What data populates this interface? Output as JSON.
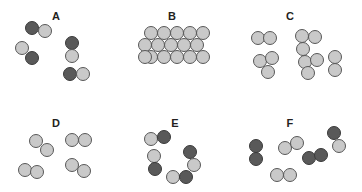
{
  "figure": {
    "width": 362,
    "height": 192,
    "background": "#ffffff",
    "type": "particle-diagram"
  },
  "colors": {
    "light_atom_fill": "#c9c9c9",
    "light_atom_stroke": "#585858",
    "dark_atom_fill": "#595959",
    "dark_atom_stroke": "#3a3a3a",
    "label_color": "#231f20",
    "background": "#ffffff"
  },
  "atom_radius": 7,
  "panels": [
    {
      "id": "A",
      "label": "A",
      "label_x": 56,
      "label_y": 10,
      "atom_count": 10,
      "composition": "5 diatomic molecules, each one dark atom bonded to one light atom",
      "atoms": [
        {
          "x": 32,
          "y": 28,
          "type": "dark"
        },
        {
          "x": 45,
          "y": 31,
          "type": "light"
        },
        {
          "x": 22,
          "y": 48,
          "type": "light"
        },
        {
          "x": 32,
          "y": 58,
          "type": "dark"
        },
        {
          "x": 72,
          "y": 43,
          "type": "dark"
        },
        {
          "x": 72,
          "y": 56,
          "type": "light"
        },
        {
          "x": 70,
          "y": 74,
          "type": "dark"
        },
        {
          "x": 83,
          "y": 74,
          "type": "light"
        }
      ]
    },
    {
      "id": "B",
      "label": "B",
      "label_x": 172,
      "label_y": 10,
      "atom_count": 16,
      "composition": "close-packed lattice of light gray atoms, three rows",
      "atoms": [
        {
          "x": 151,
          "y": 33,
          "type": "light"
        },
        {
          "x": 164,
          "y": 33,
          "type": "light"
        },
        {
          "x": 177,
          "y": 33,
          "type": "light"
        },
        {
          "x": 190,
          "y": 33,
          "type": "light"
        },
        {
          "x": 203,
          "y": 33,
          "type": "light"
        },
        {
          "x": 145,
          "y": 45,
          "type": "light"
        },
        {
          "x": 158,
          "y": 45,
          "type": "light"
        },
        {
          "x": 171,
          "y": 45,
          "type": "light"
        },
        {
          "x": 184,
          "y": 45,
          "type": "light"
        },
        {
          "x": 197,
          "y": 45,
          "type": "light"
        },
        {
          "x": 151,
          "y": 57,
          "type": "light"
        },
        {
          "x": 164,
          "y": 57,
          "type": "light"
        },
        {
          "x": 177,
          "y": 57,
          "type": "light"
        },
        {
          "x": 190,
          "y": 57,
          "type": "light"
        },
        {
          "x": 203,
          "y": 57,
          "type": "light"
        },
        {
          "x": 145,
          "y": 57,
          "type": "light"
        }
      ]
    },
    {
      "id": "C",
      "label": "C",
      "label_x": 290,
      "label_y": 10,
      "atom_count": 13,
      "composition": "clusters of light gray atoms: one pair, two triatomic bent groups, one triatomic, one pair",
      "atoms": [
        {
          "x": 258,
          "y": 38,
          "type": "light"
        },
        {
          "x": 270,
          "y": 38,
          "type": "light"
        },
        {
          "x": 260,
          "y": 61,
          "type": "light"
        },
        {
          "x": 272,
          "y": 58,
          "type": "light"
        },
        {
          "x": 268,
          "y": 72,
          "type": "light"
        },
        {
          "x": 302,
          "y": 36,
          "type": "light"
        },
        {
          "x": 315,
          "y": 37,
          "type": "light"
        },
        {
          "x": 303,
          "y": 49,
          "type": "light"
        },
        {
          "x": 305,
          "y": 62,
          "type": "light"
        },
        {
          "x": 317,
          "y": 60,
          "type": "light"
        },
        {
          "x": 308,
          "y": 73,
          "type": "light"
        },
        {
          "x": 335,
          "y": 57,
          "type": "light"
        },
        {
          "x": 335,
          "y": 70,
          "type": "light"
        }
      ]
    },
    {
      "id": "D",
      "label": "D",
      "label_x": 56,
      "label_y": 117,
      "atom_count": 8,
      "composition": "4 diatomic molecules, all light gray atoms",
      "atoms": [
        {
          "x": 36,
          "y": 141,
          "type": "light"
        },
        {
          "x": 47,
          "y": 150,
          "type": "light"
        },
        {
          "x": 25,
          "y": 170,
          "type": "light"
        },
        {
          "x": 37,
          "y": 172,
          "type": "light"
        },
        {
          "x": 72,
          "y": 140,
          "type": "light"
        },
        {
          "x": 85,
          "y": 140,
          "type": "light"
        },
        {
          "x": 72,
          "y": 165,
          "type": "light"
        },
        {
          "x": 84,
          "y": 171,
          "type": "light"
        }
      ]
    },
    {
      "id": "E",
      "label": "E",
      "label_x": 175,
      "label_y": 117,
      "atom_count": 8,
      "composition": "4 diatomic molecules, each one light atom bonded to one dark atom",
      "atoms": [
        {
          "x": 151,
          "y": 139,
          "type": "light"
        },
        {
          "x": 164,
          "y": 137,
          "type": "dark"
        },
        {
          "x": 154,
          "y": 156,
          "type": "light"
        },
        {
          "x": 155,
          "y": 169,
          "type": "dark"
        },
        {
          "x": 190,
          "y": 152,
          "type": "dark"
        },
        {
          "x": 194,
          "y": 165,
          "type": "light"
        },
        {
          "x": 173,
          "y": 177,
          "type": "light"
        },
        {
          "x": 186,
          "y": 177,
          "type": "dark"
        }
      ]
    },
    {
      "id": "F",
      "label": "F",
      "label_x": 290,
      "label_y": 117,
      "atom_count": 10,
      "composition": "5 diatomic molecules: one dark-dark, one light-light, one light-light, one dark-dark, one dark-light",
      "atoms": [
        {
          "x": 256,
          "y": 146,
          "type": "dark"
        },
        {
          "x": 256,
          "y": 159,
          "type": "dark"
        },
        {
          "x": 277,
          "y": 175,
          "type": "light"
        },
        {
          "x": 290,
          "y": 175,
          "type": "light"
        },
        {
          "x": 285,
          "y": 148,
          "type": "light"
        },
        {
          "x": 297,
          "y": 143,
          "type": "light"
        },
        {
          "x": 309,
          "y": 158,
          "type": "dark"
        },
        {
          "x": 321,
          "y": 155,
          "type": "dark"
        },
        {
          "x": 334,
          "y": 133,
          "type": "dark"
        },
        {
          "x": 339,
          "y": 146,
          "type": "light"
        }
      ]
    }
  ]
}
